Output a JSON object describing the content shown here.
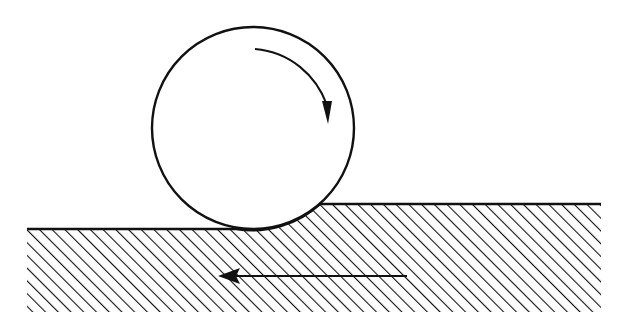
{
  "diagram": {
    "colors": {
      "stroke": "#111111",
      "background": "#ffffff"
    },
    "ball": {
      "cx": 253,
      "cy": 128,
      "r": 101,
      "rotation": "clockwise"
    },
    "ground": {
      "left_level_y": 229,
      "right_level_y": 204,
      "left_x": 27,
      "right_x": 601,
      "bottom_y": 312,
      "hatch_spacing": 9
    },
    "surface_arrow": {
      "from_x": 407,
      "to_x": 218,
      "y": 276,
      "direction": "left"
    }
  }
}
